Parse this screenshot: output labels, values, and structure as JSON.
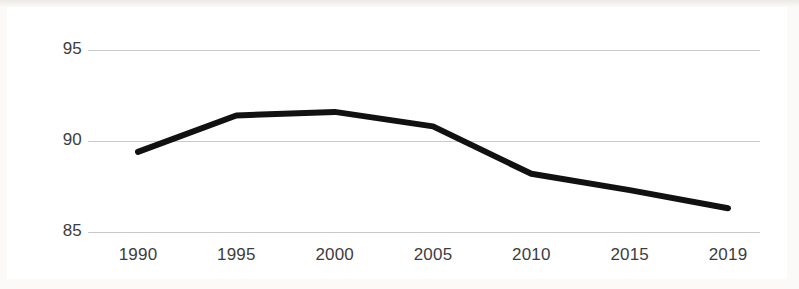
{
  "figure": {
    "background_color": "#ffffff",
    "frame_color": "#3a3a38",
    "gridline_color": "#c9c9c9",
    "line_color": "#111111",
    "tick_label_color": "#3d3d3d"
  },
  "chart_data": {
    "type": "line",
    "title": "",
    "subtitle": "",
    "xlabel": "",
    "ylabel": "",
    "x": [
      1990,
      1995,
      2000,
      2005,
      2010,
      2015,
      2019
    ],
    "categories": [
      "1990",
      "1995",
      "2000",
      "2005",
      "2010",
      "2015",
      "2019"
    ],
    "values": [
      89.4,
      91.4,
      91.6,
      90.8,
      88.2,
      87.3,
      86.3
    ],
    "series": [
      {
        "name": "",
        "values": [
          89.4,
          91.4,
          91.6,
          90.8,
          88.2,
          87.3,
          86.3
        ]
      }
    ],
    "xlim": [
      1990,
      2019
    ],
    "ylim": [
      85,
      95
    ],
    "yticks": [
      85,
      90,
      95
    ],
    "ytick_labels": [
      "85",
      "90",
      "95"
    ],
    "xticks": [
      1990,
      1995,
      2000,
      2005,
      2010,
      2015,
      2019
    ],
    "xtick_labels": [
      "1990",
      "1995",
      "2000",
      "2005",
      "2010",
      "2015",
      "2019"
    ],
    "grid": true,
    "grid_axis": "y",
    "legend": false,
    "legend_position": "none",
    "line_width_px": 6,
    "markers": false,
    "annotations": []
  }
}
